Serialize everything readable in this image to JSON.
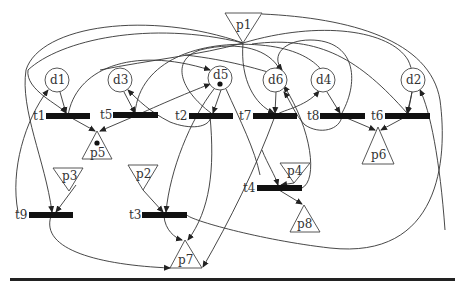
{
  "diagram": {
    "type": "petri-net",
    "places": [
      {
        "id": "d1",
        "label": "d1",
        "shape": "circle",
        "x": 57,
        "y": 80,
        "tokens": 0
      },
      {
        "id": "d3",
        "label": "d3",
        "shape": "circle",
        "x": 120,
        "y": 80,
        "tokens": 0
      },
      {
        "id": "d5",
        "label": "d5",
        "shape": "circle",
        "x": 220,
        "y": 78,
        "tokens": 1
      },
      {
        "id": "d6",
        "label": "d6",
        "shape": "circle",
        "x": 275,
        "y": 80,
        "tokens": 0
      },
      {
        "id": "d4",
        "label": "d4",
        "shape": "circle",
        "x": 323,
        "y": 80,
        "tokens": 0
      },
      {
        "id": "d2",
        "label": "d2",
        "shape": "circle",
        "x": 413,
        "y": 80,
        "tokens": 0
      },
      {
        "id": "p1",
        "label": "p1",
        "shape": "triangle-down",
        "x": 243,
        "y": 26,
        "tokens": 0
      },
      {
        "id": "p2",
        "label": "p2",
        "shape": "triangle-down",
        "x": 143,
        "y": 175,
        "tokens": 0
      },
      {
        "id": "p3",
        "label": "p3",
        "shape": "triangle-down",
        "x": 69,
        "y": 177,
        "tokens": 0
      },
      {
        "id": "p4",
        "label": "p4",
        "shape": "triangle-down",
        "x": 294,
        "y": 171,
        "tokens": 0
      },
      {
        "id": "p5",
        "label": "p5",
        "shape": "triangle-up",
        "x": 97,
        "y": 147,
        "tokens": 1
      },
      {
        "id": "p6",
        "label": "p6",
        "shape": "triangle-up",
        "x": 378,
        "y": 150,
        "tokens": 0
      },
      {
        "id": "p7",
        "label": "p7",
        "shape": "triangle-up",
        "x": 185,
        "y": 256,
        "tokens": 0
      },
      {
        "id": "p8",
        "label": "p8",
        "shape": "triangle-up",
        "x": 304,
        "y": 220,
        "tokens": 0
      }
    ],
    "transitions": [
      {
        "id": "t1",
        "label": "t1",
        "x1": 46,
        "x2": 90,
        "y": 116
      },
      {
        "id": "t5",
        "label": "t5",
        "x1": 113,
        "x2": 158,
        "y": 115
      },
      {
        "id": "t2",
        "label": "t2",
        "x1": 189,
        "x2": 233,
        "y": 116
      },
      {
        "id": "t7",
        "label": "t7",
        "x1": 253,
        "x2": 297,
        "y": 116
      },
      {
        "id": "t8",
        "label": "t8",
        "x1": 320,
        "x2": 365,
        "y": 116
      },
      {
        "id": "t6",
        "label": "t6",
        "x1": 385,
        "x2": 430,
        "y": 116
      },
      {
        "id": "t9",
        "label": "t9",
        "x1": 29,
        "x2": 73,
        "y": 215
      },
      {
        "id": "t3",
        "label": "t3",
        "x1": 142,
        "x2": 187,
        "y": 215
      },
      {
        "id": "t4",
        "label": "t4",
        "x1": 257,
        "x2": 302,
        "y": 188
      }
    ],
    "arcs": [
      {
        "from": "d1",
        "to": "t1"
      },
      {
        "from": "t1",
        "to": "p5"
      },
      {
        "from": "d3",
        "to": "t5"
      },
      {
        "from": "t5",
        "to": "p5"
      },
      {
        "from": "d5",
        "to": "t2"
      },
      {
        "from": "t2",
        "to": "d3"
      },
      {
        "from": "d6",
        "to": "t7"
      },
      {
        "from": "t7",
        "to": "d4"
      },
      {
        "from": "d4",
        "to": "t8"
      },
      {
        "from": "t8",
        "to": "p6"
      },
      {
        "from": "d2",
        "to": "t6"
      },
      {
        "from": "t6",
        "to": "p6"
      },
      {
        "from": "p3",
        "to": "t9"
      },
      {
        "from": "t9",
        "to": "p7"
      },
      {
        "from": "p2",
        "to": "t3"
      },
      {
        "from": "t3",
        "to": "p7"
      },
      {
        "from": "p4",
        "to": "t4"
      },
      {
        "from": "t4",
        "to": "p8"
      },
      {
        "from": "t9",
        "to": "d1"
      },
      {
        "from": "t5",
        "to": "d5"
      },
      {
        "from": "p1",
        "to": "t1"
      },
      {
        "from": "p1",
        "to": "t7"
      },
      {
        "from": "p1",
        "to": "t6"
      },
      {
        "from": "p1",
        "to": "t9"
      },
      {
        "from": "t3",
        "to": "d2"
      },
      {
        "from": "t4",
        "to": "d6"
      },
      {
        "from": "d5",
        "to": "t3"
      },
      {
        "from": "d5",
        "to": "p7"
      }
    ]
  }
}
